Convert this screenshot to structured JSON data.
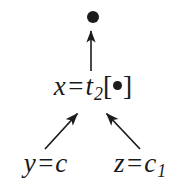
{
  "diagram": {
    "background_color": "#ffffff",
    "ink_color": "#1b1b1b",
    "nodes": {
      "root": {
        "label": "●",
        "icon": "filled-bullet-icon",
        "x": 90,
        "y": 14
      },
      "middle": {
        "lhs": "x",
        "relation": "=",
        "function": "t",
        "subscript": "2",
        "bracket_open": "[",
        "argument": "●",
        "bracket_close": "]",
        "full_text": "x = t2[●]",
        "x": 90,
        "y": 90
      },
      "left_leaf": {
        "lhs": "y",
        "relation": "=",
        "rhs": "c",
        "subscript": "",
        "full_text": "y = c",
        "x": 44,
        "y": 167
      },
      "right_leaf": {
        "lhs": "z",
        "relation": "=",
        "rhs": "c",
        "subscript": "1",
        "full_text": "z = c1",
        "x": 140,
        "y": 167
      }
    },
    "arrows": [
      {
        "name": "arrow-middle-to-root",
        "from": [
          91,
          72
        ],
        "to": [
          91,
          29
        ],
        "direction": "up",
        "style": "solid"
      },
      {
        "name": "arrow-left-leaf-to-middle",
        "from": [
          45,
          150
        ],
        "to": [
          78,
          112
        ],
        "direction": "up-right",
        "style": "solid"
      },
      {
        "name": "arrow-right-leaf-to-middle",
        "from": [
          140,
          150
        ],
        "to": [
          106,
          112
        ],
        "direction": "up-left",
        "style": "solid"
      }
    ]
  }
}
